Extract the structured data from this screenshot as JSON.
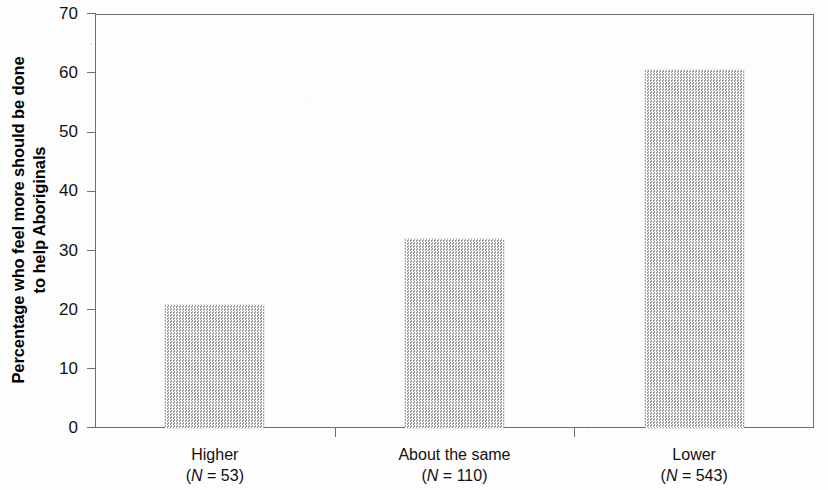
{
  "chart_data": {
    "type": "bar",
    "title": "",
    "subtitle": "",
    "xlabel": "",
    "ylabel": "Percentage who feel more should be done to help Aboriginals",
    "ylabel_lines": [
      "Percentage who feel more should be done",
      "to help Aboriginals"
    ],
    "categories": [
      "Higher",
      "About the same",
      "Lower"
    ],
    "category_sublabels": [
      "(N = 53)",
      "(N = 110)",
      "(N = 543)"
    ],
    "category_n": [
      53,
      110,
      543
    ],
    "values": [
      20.8,
      31.9,
      60.6
    ],
    "ylim": [
      0,
      70
    ],
    "ytick_values": [
      0,
      10,
      20,
      30,
      40,
      50,
      60,
      70
    ],
    "ytick_labels": [
      "0",
      "10",
      "20",
      "30",
      "40",
      "50",
      "60",
      "70"
    ],
    "grid": false,
    "legend": null,
    "legend_position": "none",
    "bar_fill_color": "#c9c9c9",
    "bar_pattern": "fine-checker-dither",
    "axis_color": "#6e6e6e",
    "text_color": "#111111",
    "background_color": "#ffffff",
    "n_prefix": "(N = ",
    "n_suffix": ")",
    "n_symbol": "N"
  },
  "figure": {
    "name": "bar-chart",
    "background_color": "#ffffff"
  }
}
